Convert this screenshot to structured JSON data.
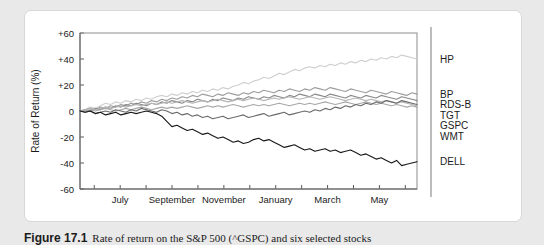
{
  "figure": {
    "caption_number": "Figure 17.1",
    "caption_text": "Rate of return on the S&P 500 (^GSPC) and six selected stocks"
  },
  "chart_data": {
    "type": "line",
    "title": "",
    "xlabel": "",
    "ylabel": "Rate of Return (%)",
    "ylim": [
      -60,
      60
    ],
    "yticks": [
      60,
      40,
      20,
      0,
      -20,
      -40,
      -60
    ],
    "ytick_labels": [
      "+60",
      "+40",
      "+20",
      "0",
      "-20",
      "-40",
      "-60"
    ],
    "grid": false,
    "legend_position": "right",
    "x_tick_count": 13,
    "xtick_labels": [
      "",
      "July",
      "",
      "September",
      "",
      "November",
      "",
      "January",
      "",
      "March",
      "",
      "May",
      ""
    ],
    "xtick_labels_visible": [
      "July",
      "September",
      "November",
      "January",
      "March",
      "May"
    ],
    "series": [
      {
        "name": "HP",
        "color": "#cfcfcf",
        "values": [
          0,
          1,
          3,
          2,
          4,
          6,
          5,
          7,
          6,
          8,
          7,
          9,
          8,
          10,
          9,
          11,
          12,
          11,
          13,
          12,
          14,
          13,
          15,
          14,
          16,
          15,
          17,
          16,
          18,
          17,
          19,
          20,
          22,
          21,
          23,
          24,
          26,
          25,
          27,
          29,
          28,
          30,
          32,
          31,
          33,
          34,
          33,
          35,
          34,
          36,
          35,
          37,
          36,
          38,
          37,
          39,
          38,
          40,
          39,
          41,
          40,
          42,
          41,
          43,
          42,
          41,
          40
        ]
      },
      {
        "name": "BP",
        "color": "#9e9e9e",
        "values": [
          0,
          1,
          2,
          1,
          3,
          2,
          4,
          3,
          5,
          4,
          6,
          5,
          7,
          6,
          8,
          7,
          9,
          8,
          10,
          9,
          11,
          10,
          12,
          11,
          13,
          12,
          11,
          13,
          12,
          14,
          13,
          12,
          14,
          13,
          15,
          14,
          16,
          15,
          14,
          16,
          15,
          17,
          16,
          15,
          17,
          16,
          18,
          17,
          16,
          18,
          17,
          16,
          15,
          17,
          16,
          15,
          14,
          16,
          15,
          14,
          13,
          15,
          14,
          13,
          12,
          14,
          13
        ]
      },
      {
        "name": "RDS-B",
        "color": "#8a8a8a",
        "values": [
          0,
          1,
          0,
          2,
          1,
          3,
          2,
          4,
          3,
          5,
          4,
          6,
          5,
          4,
          6,
          5,
          7,
          6,
          8,
          7,
          6,
          8,
          7,
          9,
          8,
          7,
          9,
          8,
          10,
          9,
          8,
          10,
          9,
          11,
          10,
          9,
          11,
          10,
          12,
          11,
          10,
          12,
          11,
          13,
          12,
          11,
          13,
          12,
          11,
          13,
          12,
          11,
          10,
          12,
          11,
          10,
          12,
          11,
          10,
          12,
          11,
          10,
          9,
          11,
          10,
          9,
          8
        ]
      },
      {
        "name": "GSPC",
        "color": "#b5b5b5",
        "values": [
          0,
          1,
          2,
          1,
          2,
          3,
          2,
          3,
          4,
          3,
          4,
          5,
          4,
          5,
          6,
          5,
          6,
          7,
          6,
          7,
          8,
          7,
          6,
          7,
          8,
          7,
          8,
          9,
          8,
          7,
          8,
          9,
          8,
          9,
          10,
          9,
          8,
          9,
          10,
          9,
          10,
          11,
          10,
          9,
          10,
          11,
          10,
          9,
          10,
          11,
          10,
          9,
          8,
          9,
          10,
          9,
          8,
          9,
          8,
          7,
          8,
          7,
          6,
          7,
          6,
          5,
          4
        ]
      },
      {
        "name": "WMT",
        "color": "#a8a8a8",
        "values": [
          0,
          0,
          1,
          0,
          1,
          2,
          1,
          0,
          1,
          2,
          1,
          2,
          3,
          2,
          1,
          2,
          3,
          2,
          3,
          2,
          3,
          4,
          3,
          2,
          3,
          4,
          3,
          4,
          3,
          4,
          5,
          4,
          3,
          4,
          5,
          4,
          5,
          4,
          5,
          6,
          5,
          4,
          5,
          6,
          5,
          6,
          5,
          6,
          7,
          6,
          5,
          6,
          7,
          6,
          5,
          6,
          7,
          6,
          5,
          6,
          5,
          4,
          5,
          4,
          3,
          4,
          3
        ]
      },
      {
        "name": "TGT",
        "color": "#6b6b6b",
        "values": [
          0,
          -1,
          0,
          -2,
          -1,
          0,
          -1,
          1,
          0,
          -1,
          1,
          0,
          2,
          1,
          0,
          -1,
          1,
          0,
          -2,
          -1,
          -3,
          -2,
          -4,
          -3,
          -5,
          -4,
          -6,
          -5,
          -4,
          -6,
          -5,
          -4,
          -3,
          -5,
          -4,
          -3,
          -2,
          -4,
          -3,
          -2,
          -1,
          -3,
          -2,
          -1,
          0,
          -1,
          1,
          0,
          2,
          1,
          3,
          2,
          4,
          3,
          5,
          4,
          6,
          5,
          7,
          6,
          8,
          7,
          6,
          8,
          7,
          6,
          5
        ]
      },
      {
        "name": "DELL",
        "color": "#1a1a1a",
        "values": [
          0,
          -1,
          0,
          -2,
          -1,
          -3,
          -2,
          -1,
          -3,
          -2,
          -1,
          -2,
          -1,
          0,
          -1,
          -2,
          -4,
          -8,
          -12,
          -11,
          -13,
          -15,
          -14,
          -16,
          -18,
          -17,
          -19,
          -21,
          -20,
          -22,
          -24,
          -23,
          -25,
          -24,
          -22,
          -21,
          -23,
          -22,
          -24,
          -26,
          -28,
          -27,
          -26,
          -28,
          -30,
          -29,
          -31,
          -30,
          -29,
          -31,
          -30,
          -32,
          -31,
          -30,
          -32,
          -34,
          -33,
          -35,
          -37,
          -36,
          -38,
          -40,
          -38,
          -42,
          -41,
          -40,
          -39
        ]
      }
    ]
  },
  "legend": {
    "items": [
      {
        "label": "HP"
      },
      {
        "label": "BP"
      },
      {
        "label": "RDS-B"
      },
      {
        "label": "GSPC"
      },
      {
        "label": "WMT"
      },
      {
        "label": "TGT"
      },
      {
        "label": "DELL"
      }
    ]
  }
}
